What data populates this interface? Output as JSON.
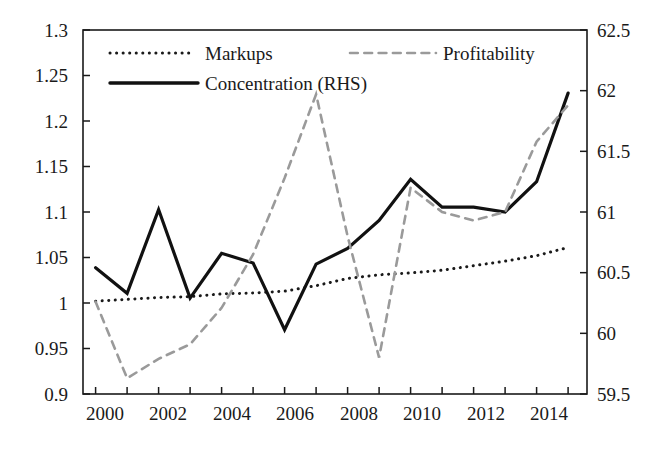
{
  "chart_data": {
    "type": "line",
    "title": "",
    "xlabel": "",
    "ylabel": "",
    "y2label": "",
    "grid": false,
    "legend_position": "top-inside",
    "x": [
      2000,
      2001,
      2002,
      2003,
      2004,
      2005,
      2006,
      2007,
      2008,
      2009,
      2010,
      2011,
      2012,
      2013,
      2014,
      2015
    ],
    "xlim": [
      1999.6,
      2015.6
    ],
    "xticks": [
      2000,
      2001,
      2002,
      2003,
      2004,
      2005,
      2006,
      2007,
      2008,
      2009,
      2010,
      2011,
      2012,
      2013,
      2014,
      2015
    ],
    "xticklabels_shown": [
      "2000",
      "2002",
      "2004",
      "2006",
      "2008",
      "2010",
      "2012",
      "2014"
    ],
    "ylim_left": [
      0.9,
      1.3
    ],
    "yticks_left": [
      0.9,
      0.95,
      1.0,
      1.05,
      1.1,
      1.15,
      1.2,
      1.25,
      1.3
    ],
    "yticklabels_left": [
      "0.9",
      "0.95",
      "1",
      "1.05",
      "1.1",
      "1.15",
      "1.2",
      "1.25",
      "1.3"
    ],
    "ylim_right": [
      59.5,
      62.5
    ],
    "yticks_right": [
      59.5,
      60.0,
      60.5,
      61.0,
      61.5,
      62.0,
      62.5
    ],
    "yticklabels_right": [
      "59.5",
      "60",
      "60.5",
      "61",
      "61.5",
      "62",
      "62.5"
    ],
    "series": [
      {
        "name": "Markups",
        "axis": "left",
        "style": "dotted",
        "color": "#1a1a1a",
        "values": [
          1.002,
          1.004,
          1.006,
          1.007,
          1.01,
          1.011,
          1.013,
          1.019,
          1.027,
          1.031,
          1.033,
          1.036,
          1.041,
          1.046,
          1.052,
          1.061
        ]
      },
      {
        "name": "Concentration (RHS)",
        "axis": "right",
        "style": "solid",
        "color": "#111111",
        "values": [
          60.54,
          60.33,
          61.02,
          60.29,
          60.66,
          60.58,
          60.03,
          60.57,
          60.7,
          60.93,
          61.27,
          61.04,
          61.04,
          61.0,
          61.25,
          61.98
        ]
      },
      {
        "name": "Profitability",
        "axis": "right",
        "style": "dashed",
        "color": "#9a9a9a",
        "values": [
          60.26,
          59.63,
          59.79,
          59.91,
          60.21,
          60.65,
          61.28,
          61.97,
          60.8,
          59.8,
          61.2,
          61.0,
          60.93,
          61.0,
          61.58,
          61.88
        ]
      }
    ]
  },
  "legend": {
    "entries": [
      {
        "label": "Markups",
        "style": "dotted",
        "color": "#1a1a1a"
      },
      {
        "label": "Concentration (RHS)",
        "style": "solid",
        "color": "#111111"
      },
      {
        "label": "Profitability",
        "style": "dashed",
        "color": "#9a9a9a"
      }
    ]
  },
  "axes": {
    "left_tick_labels": [
      "1.3",
      "1.25",
      "1.2",
      "1.15",
      "1.1",
      "1.05",
      "1",
      "0.95",
      "0.9"
    ],
    "right_tick_labels": [
      "62.5",
      "62",
      "61.5",
      "61",
      "60.5",
      "60",
      "59.5"
    ],
    "x_tick_labels": [
      "2000",
      "2002",
      "2004",
      "2006",
      "2008",
      "2010",
      "2012",
      "2014"
    ]
  }
}
